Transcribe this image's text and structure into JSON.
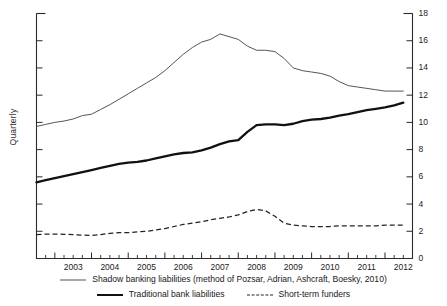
{
  "chart_data": {
    "type": "line",
    "title": "",
    "xlabel": "",
    "ylabel": "Quarterly",
    "ylim": [
      0,
      18
    ],
    "ytick_values": [
      0,
      2,
      4,
      6,
      8,
      10,
      12,
      14,
      16,
      18
    ],
    "ytick_labels": [
      "0",
      "2",
      "4",
      "6",
      "8",
      "10",
      "12",
      "14",
      "16",
      "18"
    ],
    "y_axis_position": "right",
    "xlim": [
      2002.5,
      2012.75
    ],
    "xtick_labels": [
      "2003",
      "2004",
      "2005",
      "2006",
      "2007",
      "2008",
      "2009",
      "2010",
      "2011",
      "2012"
    ],
    "xtick_values": [
      2003,
      2004,
      2005,
      2006,
      2007,
      2008,
      2009,
      2010,
      2011,
      2012
    ],
    "x_minor_tick_step": 0.25,
    "grid": false,
    "legend_position": "below",
    "x": [
      2002.5,
      2002.75,
      2003.0,
      2003.25,
      2003.5,
      2003.75,
      2004.0,
      2004.25,
      2004.5,
      2004.75,
      2005.0,
      2005.25,
      2005.5,
      2005.75,
      2006.0,
      2006.25,
      2006.5,
      2006.75,
      2007.0,
      2007.25,
      2007.5,
      2007.75,
      2008.0,
      2008.25,
      2008.5,
      2008.75,
      2009.0,
      2009.25,
      2009.5,
      2009.75,
      2010.0,
      2010.25,
      2010.5,
      2010.75,
      2011.0,
      2011.25,
      2011.5,
      2011.75,
      2012.0,
      2012.25,
      2012.5
    ],
    "series": [
      {
        "name": "Shadow banking liabilities (method of Pozsar, Adrian, Ashcraft, Boesky, 2010)",
        "style": "thin-solid",
        "color": "#555555",
        "values": [
          9.7,
          9.85,
          10.0,
          10.1,
          10.25,
          10.5,
          10.6,
          10.95,
          11.3,
          11.7,
          12.1,
          12.5,
          12.9,
          13.3,
          13.8,
          14.4,
          15.0,
          15.5,
          15.9,
          16.1,
          16.5,
          16.3,
          16.1,
          15.6,
          15.3,
          15.3,
          15.2,
          14.7,
          14.0,
          13.8,
          13.7,
          13.6,
          13.4,
          13.0,
          12.7,
          12.6,
          12.5,
          12.4,
          12.3,
          12.3,
          12.3
        ]
      },
      {
        "name": "Traditional bank liabilities",
        "style": "thick-solid",
        "color": "#111111",
        "values": [
          5.6,
          5.75,
          5.9,
          6.05,
          6.2,
          6.35,
          6.5,
          6.65,
          6.8,
          6.95,
          7.05,
          7.1,
          7.2,
          7.35,
          7.5,
          7.65,
          7.75,
          7.8,
          7.95,
          8.15,
          8.4,
          8.6,
          8.7,
          9.3,
          9.8,
          9.85,
          9.85,
          9.8,
          9.9,
          10.1,
          10.2,
          10.25,
          10.35,
          10.5,
          10.6,
          10.75,
          10.9,
          11.0,
          11.1,
          11.25,
          11.45
        ]
      },
      {
        "name": "Short-term funders",
        "style": "dashed",
        "color": "#222222",
        "values": [
          1.75,
          1.8,
          1.8,
          1.78,
          1.75,
          1.72,
          1.7,
          1.75,
          1.85,
          1.9,
          1.9,
          1.95,
          2.0,
          2.1,
          2.2,
          2.35,
          2.5,
          2.6,
          2.7,
          2.85,
          2.95,
          3.05,
          3.2,
          3.45,
          3.6,
          3.5,
          3.1,
          2.6,
          2.45,
          2.4,
          2.35,
          2.35,
          2.35,
          2.4,
          2.4,
          2.4,
          2.4,
          2.4,
          2.45,
          2.45,
          2.45
        ]
      }
    ]
  },
  "legend": {
    "rows": [
      [
        {
          "label": "Shadow banking liabilities (method of Pozsar, Adrian, Ashcraft, Boesky, 2010)",
          "swatch": "thin-solid"
        }
      ],
      [
        {
          "label": "Traditional bank liabilities",
          "swatch": "thick-solid"
        },
        {
          "label": "Short-term funders",
          "swatch": "dashed"
        }
      ]
    ]
  },
  "axis": {
    "y_title": "Quarterly"
  }
}
